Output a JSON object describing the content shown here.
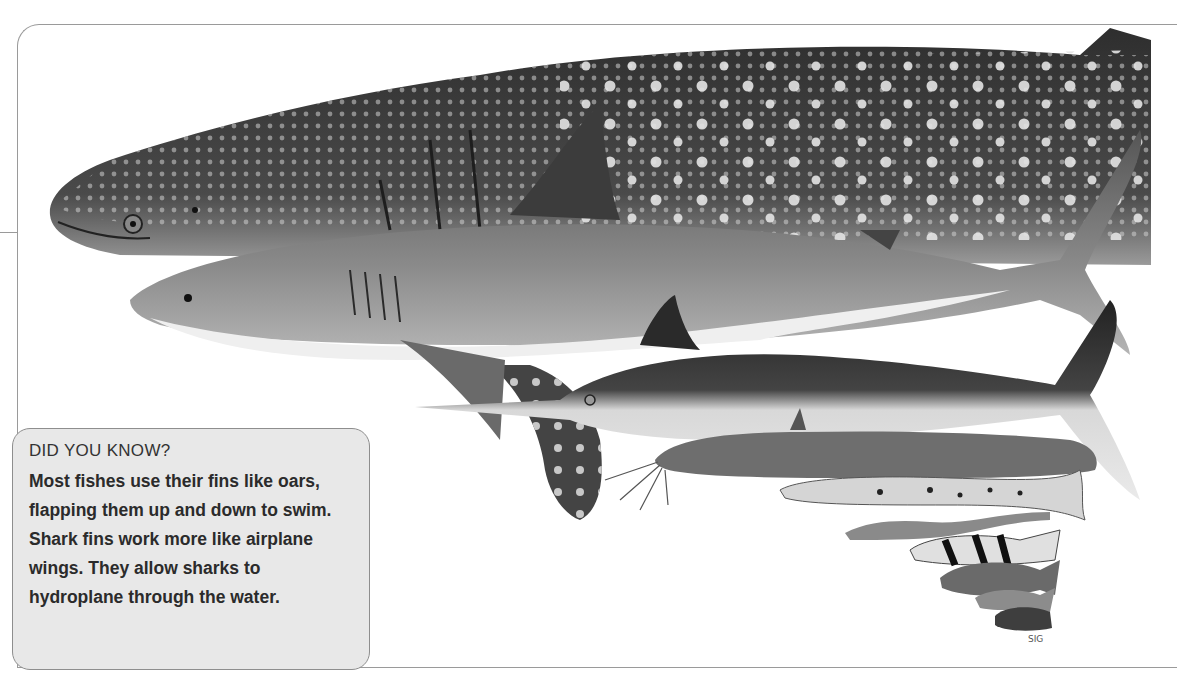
{
  "page": {
    "illustration": {
      "subjects": [
        {
          "name": "whale-shark",
          "label": "Whale shark"
        },
        {
          "name": "great-white-shark",
          "label": "Great white shark"
        },
        {
          "name": "manta-ray",
          "label": "Spotted ray"
        },
        {
          "name": "marlin",
          "label": "Marlin"
        },
        {
          "name": "catfish",
          "label": "Catfish"
        },
        {
          "name": "trout",
          "label": "Trout"
        },
        {
          "name": "eel",
          "label": "Eel"
        },
        {
          "name": "small-fishes",
          "label": "Small fishes"
        }
      ],
      "artist_signature": "SIG"
    },
    "callout": {
      "title": "DID YOU KNOW?",
      "body": "Most fishes use their fins like oars, flapping them up and down to swim. Shark fins work more like airplane wings. They allow sharks to hydroplane through the water."
    },
    "colors": {
      "frame": "#9a9a9a",
      "callout_bg": "#e8e8e8",
      "callout_border": "#8e8e8e",
      "text": "#2b2b2b"
    }
  }
}
